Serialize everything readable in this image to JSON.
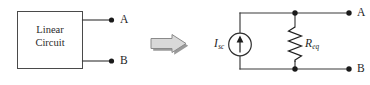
{
  "figure": {
    "type": "circuit-diagram",
    "background_color": "#ffffff",
    "line_color": "#3a3a3a"
  },
  "left_circuit": {
    "box_label_line1": "Linear",
    "box_label_line2": "Circuit",
    "terminal_a": "A",
    "terminal_b": "B"
  },
  "transform_arrow": {
    "icon": "right-block-arrow-icon",
    "fill_color": "#d9d9d9",
    "shadow_color": "#9a9a9a"
  },
  "right_circuit": {
    "source_symbol": "I",
    "source_subscript": "sc",
    "source_icon": "current-source-icon",
    "resistor_symbol": "R",
    "resistor_subscript": "eq",
    "resistor_icon": "resistor-zigzag-icon",
    "terminal_a": "A",
    "terminal_b": "B"
  }
}
